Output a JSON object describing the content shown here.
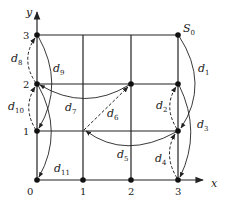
{
  "diagram": {
    "type": "grid-path-diagram",
    "axes": {
      "x_label": "x",
      "y_label": "y",
      "x_ticks": [
        "0",
        "1",
        "2",
        "3"
      ],
      "y_ticks": [
        "0",
        "1",
        "2",
        "3"
      ]
    },
    "start_label": "S",
    "start_subscript": "0",
    "nodes": [
      {
        "id": "S0",
        "x": 3,
        "y": 3
      },
      {
        "id": "n-0-3",
        "x": 0,
        "y": 3
      },
      {
        "id": "n-0-2",
        "x": 0,
        "y": 2
      },
      {
        "id": "n-2-2",
        "x": 2,
        "y": 2
      },
      {
        "id": "n-3-2",
        "x": 3,
        "y": 2
      },
      {
        "id": "n-0-1",
        "x": 0,
        "y": 1
      },
      {
        "id": "n-1-1",
        "x": 1,
        "y": 1
      },
      {
        "id": "n-3-1",
        "x": 3,
        "y": 1
      },
      {
        "id": "n-0-0",
        "x": 0,
        "y": 0
      },
      {
        "id": "n-1-0",
        "x": 1,
        "y": 0
      },
      {
        "id": "n-2-0",
        "x": 2,
        "y": 0
      },
      {
        "id": "n-3-0",
        "x": 3,
        "y": 0
      }
    ],
    "edges": [
      {
        "label": "d",
        "sub": "1",
        "from": [
          3,
          3
        ],
        "to": [
          3,
          1
        ],
        "style": "solid"
      },
      {
        "label": "d",
        "sub": "2",
        "from": [
          3,
          1
        ],
        "to": [
          3,
          2
        ],
        "style": "dashed"
      },
      {
        "label": "d",
        "sub": "3",
        "from": [
          3,
          2
        ],
        "to": [
          3,
          0
        ],
        "style": "solid"
      },
      {
        "label": "d",
        "sub": "4",
        "from": [
          3,
          0
        ],
        "to": [
          3,
          1
        ],
        "style": "dashed"
      },
      {
        "label": "d",
        "sub": "5",
        "from": [
          3,
          1
        ],
        "to": [
          1,
          1
        ],
        "style": "solid"
      },
      {
        "label": "d",
        "sub": "6",
        "from": [
          1,
          1
        ],
        "to": [
          2,
          2
        ],
        "style": "dashed"
      },
      {
        "label": "d",
        "sub": "7",
        "from": [
          2,
          2
        ],
        "to": [
          0,
          2
        ],
        "style": "solid"
      },
      {
        "label": "d",
        "sub": "8",
        "from": [
          0,
          2
        ],
        "to": [
          0,
          3
        ],
        "style": "dashed"
      },
      {
        "label": "d",
        "sub": "9",
        "from": [
          0,
          3
        ],
        "to": [
          0,
          1
        ],
        "style": "solid"
      },
      {
        "label": "d",
        "sub": "10",
        "from": [
          0,
          1
        ],
        "to": [
          0,
          2
        ],
        "style": "dashed"
      },
      {
        "label": "d",
        "sub": "11",
        "from": [
          0,
          2
        ],
        "to": [
          0,
          0
        ],
        "style": "solid"
      }
    ]
  }
}
